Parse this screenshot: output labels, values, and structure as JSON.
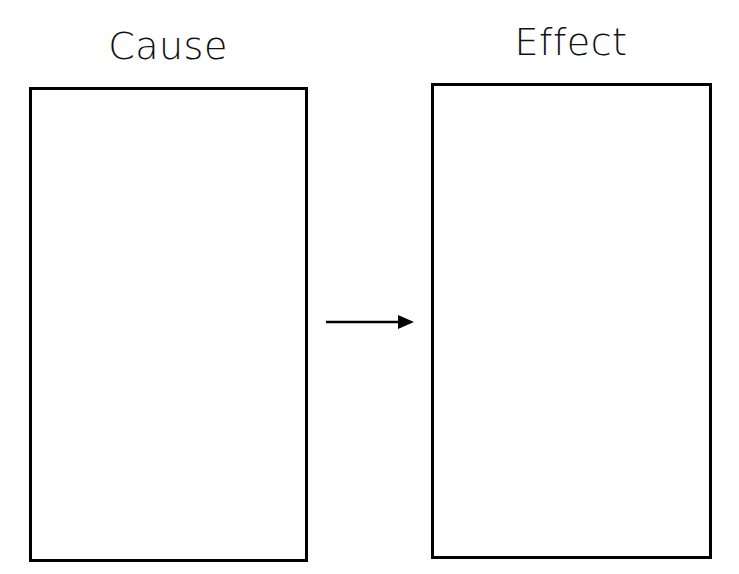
{
  "diagram": {
    "type": "cause-effect organizer",
    "cause": {
      "title": "Cause",
      "content": ""
    },
    "effect": {
      "title": "Effect",
      "content": ""
    },
    "connector": {
      "direction": "right",
      "from": "cause",
      "to": "effect"
    }
  }
}
